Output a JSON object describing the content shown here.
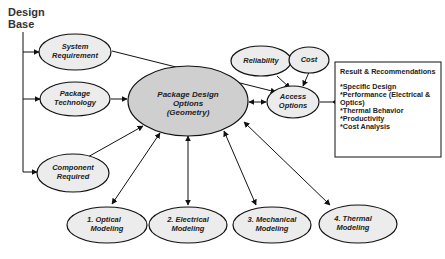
{
  "diagram": {
    "title_line1": "Design",
    "title_line2": "Base",
    "nodes": {
      "system_requirement": {
        "line1": "System",
        "line2": "Requirement"
      },
      "package_technology": {
        "line1": "Package",
        "line2": "Technology"
      },
      "component_required": {
        "line1": "Component",
        "line2": "Required"
      },
      "package_design_options": {
        "line1": "Package Design",
        "line2": "Options",
        "line3": "(Geometry)"
      },
      "reliability": {
        "line1": "Reliability"
      },
      "cost": {
        "line1": "Cost"
      },
      "access_options": {
        "line1": "Access",
        "line2": "Options"
      },
      "optical_modeling": {
        "line1": "1.  Optical",
        "line2": "Modeling"
      },
      "electrical_modeling": {
        "line1": "2. Electrical",
        "line2": "Modeling"
      },
      "mechanical_modeling": {
        "line1": "3. Mechanical",
        "line2": "Modeling"
      },
      "thermal_modeling": {
        "line1": "4. Thermal",
        "line2": "Modeling"
      }
    },
    "results_box": {
      "heading": "Result & Recommendations",
      "items": [
        "*Specific Design",
        "*Performance (Electrical &",
        "Optics)",
        "*Thermal Behavior",
        "*Productivity",
        "*Cost Analysis"
      ]
    }
  }
}
